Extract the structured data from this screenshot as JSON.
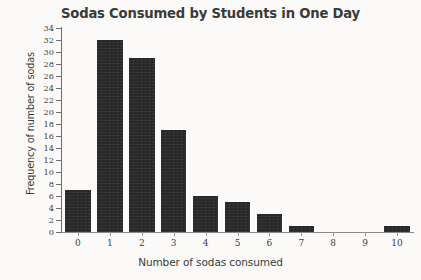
{
  "chart_data": {
    "type": "bar",
    "title": "Sodas Consumed by Students in One Day",
    "xlabel": "Number of sodas consumed",
    "ylabel": "Frequency of number of sodas",
    "categories": [
      "0",
      "1",
      "2",
      "3",
      "4",
      "5",
      "6",
      "7",
      "8",
      "9",
      "10"
    ],
    "values": [
      7,
      32,
      29,
      17,
      6,
      5,
      3,
      1,
      0,
      0,
      1
    ],
    "ylim": [
      0,
      34
    ],
    "y_ticks": [
      0,
      2,
      4,
      6,
      8,
      10,
      12,
      14,
      16,
      18,
      20,
      22,
      24,
      26,
      28,
      30,
      32,
      34
    ],
    "x_ticks": [
      "0",
      "1",
      "2",
      "3",
      "4",
      "5",
      "6",
      "7",
      "8",
      "9",
      "10"
    ],
    "grid": false,
    "legend": false,
    "bar_color": "#272727",
    "axis_color": "#6d6d6d",
    "text_color": "#3a3a3a"
  }
}
